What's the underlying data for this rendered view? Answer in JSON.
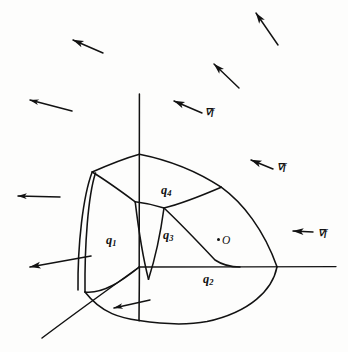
{
  "figure": {
    "kind": "hand-drawn mathematical 3d diagram",
    "background_color": "#fdfdfc",
    "ink_color": "#121212",
    "region_labels": [
      {
        "name": "q1",
        "text": "q",
        "subscript": "1",
        "x": 106,
        "y": 234
      },
      {
        "name": "q2",
        "text": "q",
        "subscript": "2",
        "x": 203,
        "y": 273
      },
      {
        "name": "q3",
        "text": "q",
        "subscript": "3",
        "x": 163,
        "y": 229
      },
      {
        "name": "q4",
        "text": "q",
        "subscript": "4",
        "x": 161,
        "y": 184
      }
    ],
    "point": {
      "label": "O",
      "dot_x": 217,
      "dot_y": 238,
      "label_x": 222,
      "label_y": 235
    },
    "gradient_labels": [
      {
        "name": "grad-f-1",
        "text": "∇f",
        "x": 205,
        "y": 108
      },
      {
        "name": "grad-f-2",
        "text": "∇f",
        "x": 277,
        "y": 163
      },
      {
        "name": "grad-f-3",
        "text": "∇f",
        "x": 318,
        "y": 229
      }
    ],
    "arrows": [
      {
        "name": "gradient-arrow-top-right-up",
        "x1": 278,
        "y1": 45,
        "x2": 256,
        "y2": 13
      },
      {
        "name": "gradient-arrow-upper-left",
        "x1": 103,
        "y1": 53,
        "x2": 73,
        "y2": 40
      },
      {
        "name": "gradient-arrow-upper-mid-right",
        "x1": 239,
        "y1": 88,
        "x2": 214,
        "y2": 64
      },
      {
        "name": "gradient-arrow-mid-left",
        "x1": 72,
        "y1": 111,
        "x2": 30,
        "y2": 100
      },
      {
        "name": "gradient-arrow-labelled-1",
        "x1": 202,
        "y1": 113,
        "x2": 174,
        "y2": 101
      },
      {
        "name": "gradient-arrow-labelled-2",
        "x1": 273,
        "y1": 169,
        "x2": 251,
        "y2": 160
      },
      {
        "name": "gradient-arrow-left-upper-face",
        "x1": 60,
        "y1": 197,
        "x2": 18,
        "y2": 196
      },
      {
        "name": "gradient-arrow-labelled-3",
        "x1": 313,
        "y1": 232,
        "x2": 293,
        "y2": 231
      },
      {
        "name": "gradient-arrow-left-lower-face",
        "x1": 91,
        "y1": 256,
        "x2": 30,
        "y2": 267
      },
      {
        "name": "gradient-arrow-bottom-face",
        "x1": 150,
        "y1": 300,
        "x2": 114,
        "y2": 308
      }
    ],
    "axes": [
      {
        "name": "vertical-axis",
        "from": [
          139,
          94
        ],
        "to": [
          139,
          267
        ]
      },
      {
        "name": "horizontal-axis",
        "from": [
          139,
          267
        ],
        "to": [
          336,
          267
        ]
      },
      {
        "name": "oblique-axis",
        "from": [
          139,
          267
        ],
        "to": [
          42,
          338
        ]
      }
    ],
    "solid": {
      "name": "curved-polyhedral-region",
      "description": "rounded three-dimensional block occupying the first octant with four visible curved faces",
      "top_vertex": [
        139,
        154
      ],
      "origin_vertex": [
        139,
        267
      ],
      "right_vertex": [
        277,
        267
      ]
    }
  }
}
